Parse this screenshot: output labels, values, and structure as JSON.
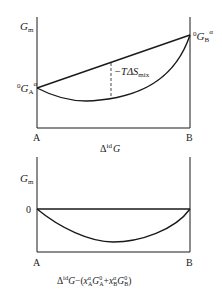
{
  "top_diagram": {
    "y_axis_label": "G",
    "y_axis_label_sub": "m",
    "left_point_label": {
      "pre_sup": "0",
      "main": "G",
      "sub": "A",
      "sup": "α"
    },
    "right_point_label": {
      "pre_sup": "0",
      "main": "G",
      "sub": "B",
      "sup": "α"
    },
    "gap_label": {
      "prefix": "−TΔS",
      "sub": "mix"
    },
    "x_left_label": "A",
    "x_right_label": "B",
    "caption_main": "Δ",
    "caption_sup": "id",
    "caption_tail": "G"
  },
  "bottom_diagram": {
    "y_axis_label": "G",
    "y_axis_label_sub": "m",
    "zero_label": "0",
    "x_left_label": "A",
    "x_right_label": "B",
    "caption": "Δ^id G − (x_A^α G_A^0 + x_B^α G_B^0)"
  }
}
